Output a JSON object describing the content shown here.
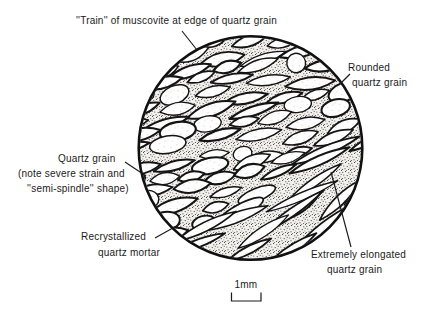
{
  "figure": {
    "type": "photomicrograph-sketch",
    "background": "#ffffff",
    "ink": "#1a1a1a"
  },
  "labels": {
    "train": "''Train'' of muscovite at edge of quartz grain",
    "rounded_line1": "Rounded",
    "rounded_line2": "quartz grain",
    "strained_line1": "Quartz grain",
    "strained_line2": "(note severe strain and",
    "strained_line3": "''semi-spindle'' shape)",
    "mortar_line1": "Recrystallized",
    "mortar_line2": "quartz mortar",
    "elongated_line1": "Extremely elongated",
    "elongated_line2": "quartz grain"
  },
  "scale_bar": {
    "label": "1mm"
  }
}
